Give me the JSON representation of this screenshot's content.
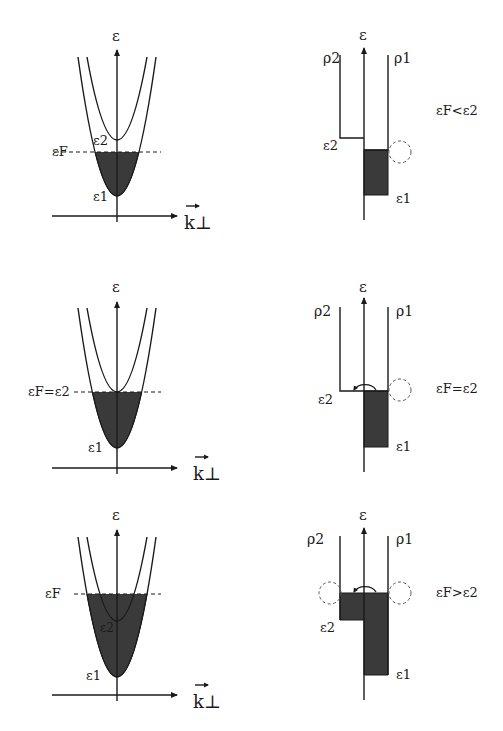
{
  "figure": {
    "rows": [
      {
        "condition_label": "εF<ε2",
        "dispersion": {
          "y_axis_label": "ε",
          "x_axis_label": "k⊥",
          "fermi_label": "εF",
          "band1_label": "ε1",
          "band2_label": "ε2"
        },
        "dos": {
          "y_axis_label": "ε",
          "rho1_label": "ρ1",
          "rho2_label": "ρ2",
          "band1_label": "ε1",
          "band2_label": "ε2",
          "transition_arc": false,
          "left_circle": false,
          "right_circle": true
        }
      },
      {
        "condition_label": "εF=ε2",
        "dispersion": {
          "y_axis_label": "ε",
          "x_axis_label": "k⊥",
          "fermi_label": "εF=ε2",
          "band1_label": "ε1",
          "band2_label": ""
        },
        "dos": {
          "y_axis_label": "ε",
          "rho1_label": "ρ1",
          "rho2_label": "ρ2",
          "band1_label": "ε1",
          "band2_label": "ε2",
          "transition_arc": true,
          "left_circle": false,
          "right_circle": true
        }
      },
      {
        "condition_label": "εF>ε2",
        "dispersion": {
          "y_axis_label": "ε",
          "x_axis_label": "k⊥",
          "fermi_label": "εF",
          "band1_label": "ε1",
          "band2_label": "ε2"
        },
        "dos": {
          "y_axis_label": "ε",
          "rho1_label": "ρ1",
          "rho2_label": "ρ2",
          "band1_label": "ε1",
          "band2_label": "ε2",
          "transition_arc": true,
          "left_circle": true,
          "right_circle": true
        }
      }
    ]
  }
}
